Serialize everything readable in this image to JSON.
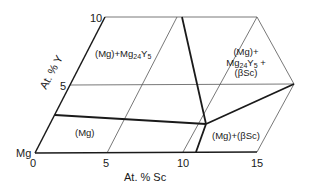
{
  "diagram": {
    "origin_label": "Mg",
    "x_axis": {
      "label": "At. % Sc",
      "ticks": [
        "0",
        "5",
        "10",
        "15"
      ]
    },
    "y_axis": {
      "label": "At. % Y",
      "ticks": [
        "5",
        "10"
      ]
    },
    "regions": [
      {
        "id": "mg",
        "label": "(Mg)"
      },
      {
        "id": "mg-mg24y5",
        "label_main": "(Mg)+Mg",
        "label_sub": "24",
        "label_tail": "Y",
        "label_sub2": "5"
      },
      {
        "id": "three-phase",
        "line1": "(Mg)+",
        "line2_main": "Mg",
        "line2_sub": "24",
        "line2_mid": "Y",
        "line2_sub2": "5",
        "line2_tail": " +",
        "line3": "(βSc)"
      },
      {
        "id": "mg-bsc",
        "label": "(Mg)+(βSc)"
      }
    ],
    "colors": {
      "ink": "#1a1a1a",
      "grid": "#555555",
      "background": "#ffffff"
    }
  }
}
